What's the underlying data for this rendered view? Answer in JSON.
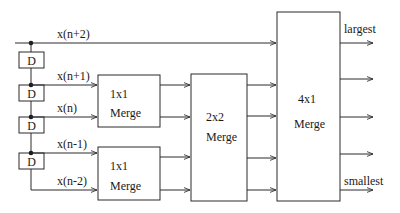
{
  "diagram": {
    "inputs": [
      {
        "label": "x(n+2)"
      },
      {
        "label": "x(n+1)"
      },
      {
        "label": "x(n)"
      },
      {
        "label": "x(n-1)"
      },
      {
        "label": "x(n-2)"
      }
    ],
    "delays": [
      {
        "label": "D"
      },
      {
        "label": "D"
      },
      {
        "label": "D"
      },
      {
        "label": "D"
      }
    ],
    "merge_top": {
      "size": "1x1",
      "label": "Merge"
    },
    "merge_bottom": {
      "size": "1x1",
      "label": "Merge"
    },
    "merge_mid": {
      "size": "2x2",
      "label": "Merge"
    },
    "merge_final": {
      "size": "4x1",
      "label": "Merge"
    },
    "outputs": {
      "largest": "largest",
      "smallest": "smallest"
    },
    "colors": {
      "line": "#2a2a2a",
      "background": "#ffffff"
    }
  }
}
